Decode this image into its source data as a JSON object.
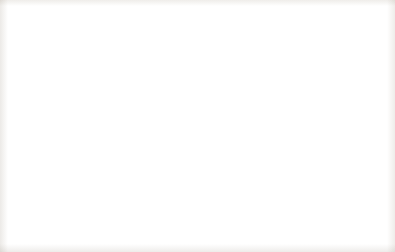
{
  "figure": {
    "title_line1": "Variance of",
    "title_line2": "polity data",
    "axis_caption": "Freedom House democracy level (polity scale)"
  },
  "chart_data": {
    "type": "bar",
    "xlabel": "Freedom House democracy level (polity scale)",
    "ylabel": "Variance of polity data",
    "xlim": [
      -10,
      10
    ],
    "ylim": [
      0,
      30
    ],
    "grid": false,
    "legend": null,
    "x_tick_labels": [
      "-10",
      "0",
      "10"
    ],
    "x_tick_values": [
      -10,
      0,
      10
    ],
    "y_tick_labels": [
      "0",
      "5",
      "10",
      "15",
      "20",
      "25",
      "30"
    ],
    "y_tick_values": [
      0,
      5,
      10,
      15,
      20,
      25,
      30
    ],
    "bin_edges": [
      -10,
      -8.571,
      -7.143,
      -5.714,
      -4.286,
      -2.857,
      -1.429,
      0,
      1.429,
      2.857,
      4.286,
      5.714,
      7.143,
      8.571,
      10
    ],
    "categories": [
      "-10 to -8.6",
      "-8.6 to -7.1",
      "-7.1 to -5.7",
      "-5.7 to -4.3",
      "-4.3 to -2.9",
      "-2.9 to -1.4",
      "-1.4 to 0",
      "0 to 1.4",
      "1.4 to 2.9",
      "2.9 to 4.3",
      "4.3 to 5.7",
      "5.7 to 7.1",
      "7.1 to 8.6",
      "8.6 to 10"
    ],
    "values": [
      2,
      3,
      7,
      12,
      13,
      26,
      30,
      23,
      18,
      8,
      8,
      4,
      1,
      0.3
    ]
  }
}
